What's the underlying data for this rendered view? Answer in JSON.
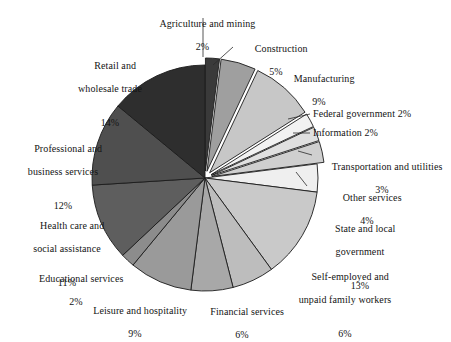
{
  "chart_data": {
    "type": "pie",
    "title": "",
    "subtitle": "",
    "xlabel": "",
    "ylabel": "",
    "legend_position": "labels-around-pie",
    "grid": false,
    "units": "percent",
    "start_angle_deg": 0,
    "direction": "clockwise",
    "categories": [
      "Agriculture and mining",
      "Construction",
      "Manufacturing",
      "Federal government",
      "Information",
      "Transportation and utilities",
      "Other services",
      "State and local government",
      "Self-employed and unpaid family workers",
      "Financial services",
      "Leisure and hospitality",
      "Educational services",
      "Health care and social assistance",
      "Professional and business services",
      "Retail and wholesale trade"
    ],
    "values": [
      2,
      5,
      9,
      2,
      2,
      3,
      4,
      13,
      6,
      6,
      9,
      2,
      11,
      12,
      14
    ],
    "slices": [
      {
        "label": "Agriculture and mining",
        "value": 2,
        "pct_text": "2%",
        "color": "#3a3a3a",
        "exploded": true
      },
      {
        "label": "Construction",
        "value": 5,
        "pct_text": "5%",
        "color": "#9f9f9f",
        "exploded": true
      },
      {
        "label": "Manufacturing",
        "value": 9,
        "pct_text": "9%",
        "color": "#c7c7c7",
        "exploded": true
      },
      {
        "label": "Federal government",
        "value": 2,
        "pct_text": "2%",
        "color": "#f2f2f2",
        "exploded": true
      },
      {
        "label": "Information",
        "value": 2,
        "pct_text": "2%",
        "color": "#e0e0e0",
        "exploded": true
      },
      {
        "label": "Transportation and utilities",
        "value": 3,
        "pct_text": "3%",
        "color": "#cfcfcf",
        "exploded": true
      },
      {
        "label": "Other services",
        "value": 4,
        "pct_text": "4%",
        "color": "#efefef",
        "exploded": false
      },
      {
        "label": "State and local government",
        "value": 13,
        "pct_text": "13%",
        "color": "#c9c9c9",
        "exploded": false
      },
      {
        "label": "Self-employed and unpaid family workers",
        "value": 6,
        "pct_text": "6%",
        "color": "#bdbdbd",
        "exploded": false
      },
      {
        "label": "Financial services",
        "value": 6,
        "pct_text": "6%",
        "color": "#a8a8a8",
        "exploded": false
      },
      {
        "label": "Leisure and hospitality",
        "value": 9,
        "pct_text": "9%",
        "color": "#9a9a9a",
        "exploded": false
      },
      {
        "label": "Educational services",
        "value": 2,
        "pct_text": "2%",
        "color": "#8c8c8c",
        "exploded": false
      },
      {
        "label": "Health care and social assistance",
        "value": 11,
        "pct_text": "11%",
        "color": "#5e5e5e",
        "exploded": false
      },
      {
        "label": "Professional and business services",
        "value": 12,
        "pct_text": "12%",
        "color": "#4f4f4f",
        "exploded": false
      },
      {
        "label": "Retail and wholesale trade",
        "value": 14,
        "pct_text": "14%",
        "color": "#2e2e2e",
        "exploded": false
      }
    ]
  },
  "labels": {
    "agriculture": {
      "line1": "Agriculture and mining",
      "pct": "2%"
    },
    "construction": {
      "line1": "Construction",
      "pct": "5%"
    },
    "manufacturing": {
      "line1": "Manufacturing",
      "pct": "9%"
    },
    "federal_government": {
      "line1": "Federal government 2%"
    },
    "information": {
      "line1": "Information 2%"
    },
    "transportation": {
      "line1": "Transportation and utilities",
      "pct": "3%"
    },
    "other_services": {
      "line1": "Other services",
      "pct": "4%"
    },
    "state_local": {
      "line1": "State and local",
      "line2": "government",
      "pct": "13%"
    },
    "self_employed": {
      "line1": "Self-employed and",
      "line2": "unpaid family workers",
      "pct": "6%"
    },
    "financial": {
      "line1": "Financial services",
      "pct": "6%"
    },
    "leisure": {
      "line1": "Leisure and hospitality",
      "pct": "9%"
    },
    "educational": {
      "line1": "Educational services",
      "pct": "2%"
    },
    "health_care": {
      "line1": "Health care and",
      "line2": "social assistance",
      "pct": "11%"
    },
    "professional": {
      "line1": "Professional and",
      "line2": "business services",
      "pct": "12%"
    },
    "retail": {
      "line1": "Retail and",
      "line2": "wholesale trade",
      "pct": "14%"
    }
  },
  "style": {
    "stroke_color": "#1c1c1c",
    "background": "#ffffff",
    "leader_color": "#2b2b2b"
  },
  "geometry": {
    "cx": 205,
    "cy": 178,
    "radius": 113,
    "explode_offset": 7
  }
}
